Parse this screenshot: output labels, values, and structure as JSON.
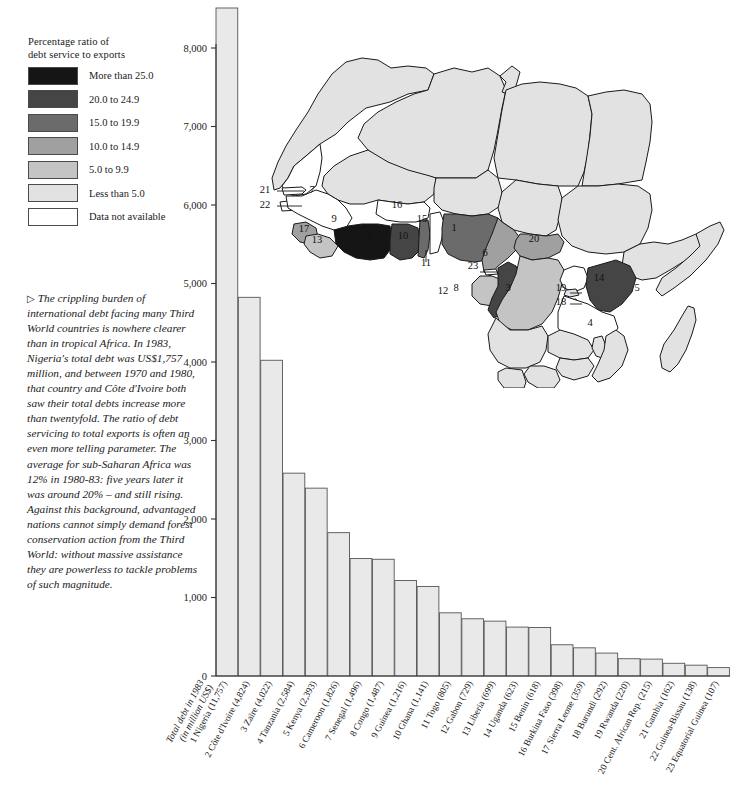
{
  "legend": {
    "title_line1": "Percentage ratio of",
    "title_line2": "debt service to exports",
    "items": [
      {
        "label": "More than 25.0",
        "color": "#151515"
      },
      {
        "label": "20.0 to 24.9",
        "color": "#454545"
      },
      {
        "label": "15.0 to 19.9",
        "color": "#6b6b6b"
      },
      {
        "label": "10.0 to 14.9",
        "color": "#a0a0a0"
      },
      {
        "label": "5.0 to 9.9",
        "color": "#c4c4c4"
      },
      {
        "label": "Less than 5.0",
        "color": "#e2e2e2"
      },
      {
        "label": "Data not available",
        "color": "#ffffff"
      }
    ]
  },
  "caption": {
    "marker": "▷",
    "text": "The crippling burden of international debt facing many Third World countries is nowhere clearer than in tropical Africa. In 1983, Nigeria's total debt was US$1,757 million, and between 1970 and 1980, that country and Côte d'Ivoire both saw their total debts increase more than twentyfold. The ratio of debt servicing to total exports is often an even more telling parameter. The average for sub-Saharan Africa was 12% in 1980-83: five years later it was around 20% – and still rising. Against this background, advantaged nations cannot simply demand forest conservation action from the Third World: without massive assistance they are powerless to tackle problems of such magnitude."
  },
  "chart_data": {
    "type": "bar",
    "title": "",
    "xlabel": "",
    "ylabel_line1": "Total debt in 1983",
    "ylabel_line2": "(in million US$)",
    "ylim": [
      0,
      8000
    ],
    "yticks": [
      0,
      1000,
      2000,
      3000,
      4000,
      5000,
      6000,
      7000,
      8000
    ],
    "ytick_labels": [
      "0",
      "1,000",
      "2,000",
      "3,000",
      "4,000",
      "5,000",
      "6,000",
      "7,000",
      "8,000"
    ],
    "grid": false,
    "legend_position": "none",
    "note": "Bar 1 (Nigeria) exceeds the plotted axis maximum and is clipped at the top of the frame.",
    "categories": [
      "1 Nigeria (11,757)",
      "2 Côte d'Ivoire (4,824)",
      "3 Zaïre (4,022)",
      "4 Tanzania (2,584)",
      "5 Kenya (2,393)",
      "6 Cameroon (1,826)",
      "7 Senegal (1,496)",
      "8 Congo (1,487)",
      "9 Guinea (1,216)",
      "10 Ghana (1,141)",
      "11 Togo (805)",
      "12 Gabon (729)",
      "13 Liberia (699)",
      "14 Uganda (623)",
      "15 Benin (618)",
      "16 Burkina Faso (398)",
      "17 Sierra Leone (359)",
      "18 Burundi (292)",
      "19 Rwanda (220)",
      "20 Cent. African Rep. (215)",
      "21 Gambia (162)",
      "22 Guinea-Bissau (138)",
      "23 Equatorial Guinea (107)"
    ],
    "values": [
      11757,
      4824,
      4022,
      2584,
      2393,
      1826,
      1496,
      1487,
      1216,
      1141,
      805,
      729,
      699,
      623,
      618,
      398,
      359,
      292,
      220,
      215,
      162,
      138,
      107
    ]
  },
  "map": {
    "title": "",
    "labels": [
      {
        "n": "1",
        "x": 196,
        "y": 193,
        "dark": true
      },
      {
        "n": "2",
        "x": 112,
        "y": 202,
        "dark": true
      },
      {
        "n": "3",
        "x": 250,
        "y": 253,
        "dark": false
      },
      {
        "n": "4",
        "x": 332,
        "y": 288,
        "dark": false
      },
      {
        "n": "5",
        "x": 379,
        "y": 253,
        "dark": true
      },
      {
        "n": "6",
        "x": 227,
        "y": 218,
        "dark": false
      },
      {
        "n": "7",
        "x": 54,
        "y": 155,
        "dark": false
      },
      {
        "n": "8",
        "x": 198,
        "y": 253,
        "dark": true
      },
      {
        "n": "9",
        "x": 76,
        "y": 184,
        "dark": false
      },
      {
        "n": "10",
        "x": 145,
        "y": 201,
        "dark": true
      },
      {
        "n": "11",
        "x": 168,
        "y": 228,
        "dark": false
      },
      {
        "n": "12",
        "x": 185,
        "y": 256,
        "dark": false
      },
      {
        "n": "13",
        "x": 59,
        "y": 205,
        "dark": false
      },
      {
        "n": "14",
        "x": 341,
        "y": 243,
        "dark": false
      },
      {
        "n": "15",
        "x": 164,
        "y": 184,
        "dark": false
      },
      {
        "n": "16",
        "x": 139,
        "y": 170,
        "dark": false
      },
      {
        "n": "17",
        "x": 46,
        "y": 194,
        "dark": false
      },
      {
        "n": "18",
        "x": 303,
        "y": 267,
        "dark": false
      },
      {
        "n": "19",
        "x": 303,
        "y": 253,
        "dark": false
      },
      {
        "n": "20",
        "x": 276,
        "y": 204,
        "dark": false
      },
      {
        "n": "21",
        "x": 7,
        "y": 155,
        "dark": false
      },
      {
        "n": "22",
        "x": 7,
        "y": 170,
        "dark": false
      },
      {
        "n": "23",
        "x": 215,
        "y": 231,
        "dark": false
      }
    ]
  }
}
